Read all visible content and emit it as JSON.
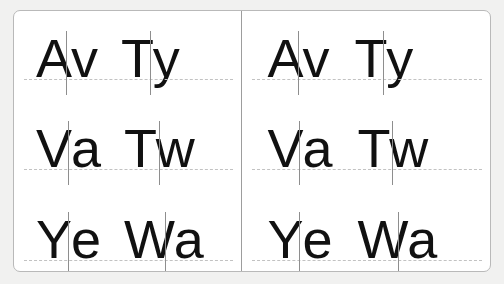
{
  "card": {
    "background_color": "#ffffff",
    "border_color": "#b9b9b9",
    "page_background_color": "#f1f1f0",
    "divider_color": "#9d9d9d",
    "baseline_color": "#c2c2c2",
    "tick_color": "#8e8e8e",
    "glyph_color": "#111111"
  },
  "panels": [
    {
      "name": "left-panel",
      "rows": [
        {
          "pairs": [
            {
              "first": "A",
              "second": "v",
              "text": "Av"
            },
            {
              "first": "T",
              "second": "y",
              "text": "Ty"
            }
          ]
        },
        {
          "pairs": [
            {
              "first": "V",
              "second": "a",
              "text": "Va"
            },
            {
              "first": "T",
              "second": "w",
              "text": "Tw"
            }
          ]
        },
        {
          "pairs": [
            {
              "first": "Y",
              "second": "e",
              "text": "Ye"
            },
            {
              "first": "W",
              "second": "a",
              "text": "Wa"
            }
          ]
        }
      ]
    },
    {
      "name": "right-panel",
      "rows": [
        {
          "pairs": [
            {
              "first": "A",
              "second": "v",
              "text": "Av"
            },
            {
              "first": "T",
              "second": "y",
              "text": "Ty"
            }
          ]
        },
        {
          "pairs": [
            {
              "first": "V",
              "second": "a",
              "text": "Va"
            },
            {
              "first": "T",
              "second": "w",
              "text": "Tw"
            }
          ]
        },
        {
          "pairs": [
            {
              "first": "Y",
              "second": "e",
              "text": "Ye"
            },
            {
              "first": "W",
              "second": "a",
              "text": "Wa"
            }
          ]
        }
      ]
    }
  ]
}
